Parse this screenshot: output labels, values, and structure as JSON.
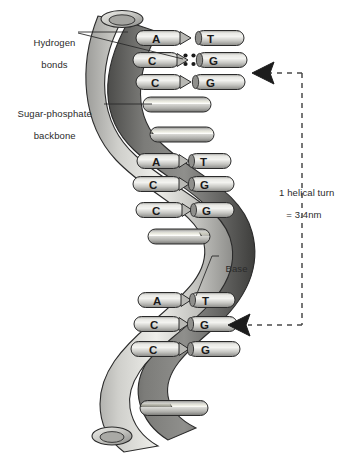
{
  "diagram": {
    "type": "scientific-illustration",
    "background_color": "#ffffff"
  },
  "labels": {
    "hydrogen_bonds": {
      "line1": "Hydrogen",
      "line2": "bonds"
    },
    "sugar_phosphate": {
      "line1": "Sugar-phosphate",
      "line2": "backbone"
    },
    "base": {
      "line1": "Base"
    },
    "helical_turn": {
      "line1": "1 helical turn",
      "line2": "= 3.4nm"
    }
  },
  "structure": {
    "backbone_strand_count": 2,
    "helical_turns_shown": 3,
    "base_pair_groups": [
      {
        "group": "top",
        "pairs": [
          {
            "left": "A",
            "right": "T",
            "hydrogen_bond_dots": 0
          },
          {
            "left": "C",
            "right": "G",
            "hydrogen_bond_dots": 4
          },
          {
            "left": "C",
            "right": "G",
            "hydrogen_bond_dots": 0
          }
        ],
        "plain_rungs": 1
      },
      {
        "group": "middle",
        "pairs": [
          {
            "left": "A",
            "right": "T",
            "hydrogen_bond_dots": 0
          },
          {
            "left": "C",
            "right": "G",
            "hydrogen_bond_dots": 0
          },
          {
            "left": "C",
            "right": "G",
            "hydrogen_bond_dots": 0
          }
        ],
        "plain_rungs": 2
      },
      {
        "group": "bottom",
        "pairs": [
          {
            "left": "A",
            "right": "T",
            "hydrogen_bond_dots": 0
          },
          {
            "left": "C",
            "right": "G",
            "hydrogen_bond_dots": 0
          },
          {
            "left": "C",
            "right": "G",
            "hydrogen_bond_dots": 0
          }
        ],
        "plain_rungs": 1
      }
    ]
  },
  "measurement_bracket": {
    "orientation": "vertical-dashed",
    "arrow_count": 2,
    "arrow_direction": "left",
    "annotation": "1 helical turn = 3.4nm"
  },
  "colors": {
    "backbone_light": "#d3d3d0",
    "backbone_dark": "#6e6e6c",
    "rung_fill": "#c9c9c6",
    "outline": "#2b2b2b",
    "text": "#2b2b2b",
    "dashed_line": "#4a4a4a"
  },
  "icons": {
    "arrow_top": "arrow-left-icon",
    "arrow_bottom": "arrow-left-icon",
    "hydrogen_dot": "dot-icon"
  }
}
